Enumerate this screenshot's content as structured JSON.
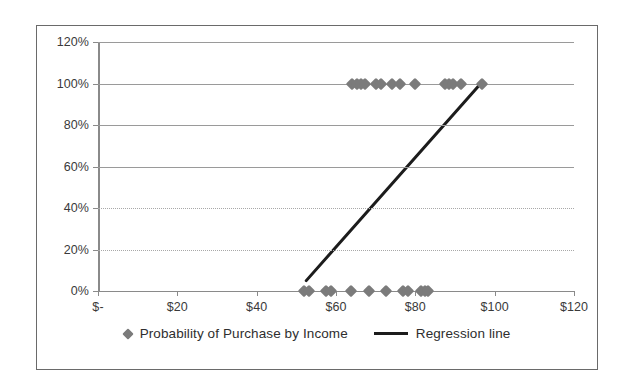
{
  "chart_data": {
    "type": "scatter",
    "title": "",
    "xlabel": "",
    "ylabel": "",
    "xlim": [
      0,
      120
    ],
    "ylim": [
      0,
      1.2
    ],
    "grid": true,
    "legend_position": "bottom",
    "x_tick_labels": [
      "$-",
      "$20",
      "$40",
      "$60",
      "$80",
      "$100",
      "$120"
    ],
    "x_tick_values": [
      0,
      20,
      40,
      60,
      80,
      100,
      120
    ],
    "y_tick_labels": [
      "0%",
      "20%",
      "40%",
      "60%",
      "80%",
      "100%",
      "120%"
    ],
    "y_tick_values": [
      0,
      0.2,
      0.4,
      0.6,
      0.8,
      1.0,
      1.2
    ],
    "series": [
      {
        "name": "Probability of Purchase by Income",
        "type": "scatter",
        "marker": "diamond",
        "color": "#7b7b7b",
        "points": [
          [
            52.0,
            0.0
          ],
          [
            53.3,
            0.0
          ],
          [
            57.6,
            0.0
          ],
          [
            58.8,
            0.0
          ],
          [
            63.8,
            0.0
          ],
          [
            68.3,
            0.0
          ],
          [
            72.6,
            0.0
          ],
          [
            77.0,
            0.0
          ],
          [
            78.2,
            0.0
          ],
          [
            81.5,
            0.0
          ],
          [
            82.4,
            0.0
          ],
          [
            83.3,
            0.0
          ],
          [
            64.0,
            1.0
          ],
          [
            65.2,
            1.0
          ],
          [
            66.4,
            1.0
          ],
          [
            67.3,
            1.0
          ],
          [
            70.0,
            1.0
          ],
          [
            71.4,
            1.0
          ],
          [
            74.0,
            1.0
          ],
          [
            76.2,
            1.0
          ],
          [
            79.8,
            1.0
          ],
          [
            87.5,
            1.0
          ],
          [
            88.5,
            1.0
          ],
          [
            89.5,
            1.0
          ],
          [
            91.5,
            1.0
          ],
          [
            96.8,
            1.0
          ]
        ]
      },
      {
        "name": "Regression line",
        "type": "line",
        "color": "#1c1c1c",
        "points": [
          [
            52.5,
            0.05
          ],
          [
            96.5,
            1.0
          ]
        ]
      }
    ]
  },
  "legend": {
    "entries": [
      {
        "label": "Probability of Purchase by Income",
        "marker": "diamond-marker-icon"
      },
      {
        "label": "Regression line",
        "marker": "line-marker-icon"
      }
    ]
  },
  "colors": {
    "marker": "#7b7b7b",
    "line": "#1c1c1c",
    "gridline": "#9a9a9a",
    "axis": "#8a8a8a",
    "border": "#6a6a6a",
    "text": "#3a3a3a",
    "background": "#ffffff"
  }
}
